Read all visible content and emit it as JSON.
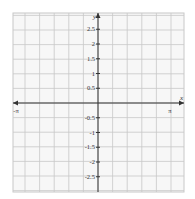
{
  "chart_data": {
    "type": "line",
    "title": "",
    "xlabel": "x",
    "ylabel": "y",
    "xlim": [
      -3.1416,
      3.1416
    ],
    "ylim": [
      -3,
      3
    ],
    "grid": true,
    "x_tick_labels": [
      "-π",
      "π"
    ],
    "y_tick_labels": [
      "2.5",
      "2",
      "1.5",
      "1",
      "0.5",
      "-0.5",
      "-1",
      "-1.5",
      "-2",
      "-2.5"
    ],
    "series": [
      {
        "name": "f(x)",
        "x": [
          -3.14,
          -2.8,
          -2.5,
          -2.2,
          -1.9,
          -1.6,
          -1.3,
          -1.0,
          -0.7,
          -0.4,
          -0.2,
          0,
          0.2,
          0.4,
          0.7,
          1.0,
          1.3,
          1.6,
          1.9,
          2.2,
          2.5,
          2.8,
          3.14
        ],
        "y": [
          0,
          0.08,
          0.1,
          -0.1,
          -0.7,
          -1.15,
          -1.0,
          -0.2,
          0.8,
          1.6,
          1.9,
          2.0,
          1.9,
          1.6,
          0.8,
          -0.2,
          -1.0,
          -1.15,
          -0.7,
          -0.1,
          0.1,
          0.08,
          0
        ]
      }
    ]
  },
  "colors": {
    "curve": "#444444",
    "grid": "#c8c8c8",
    "axis": "#333333"
  }
}
